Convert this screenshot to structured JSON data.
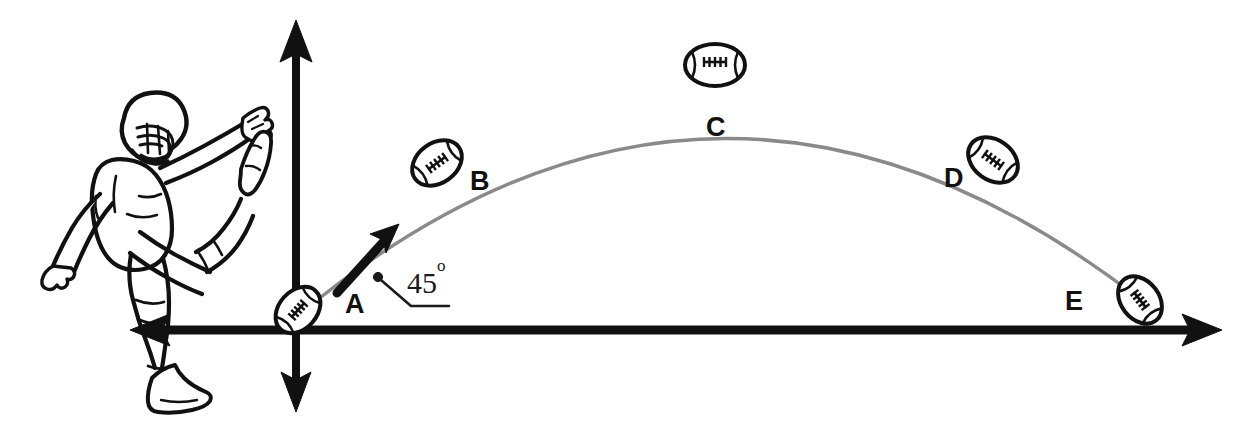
{
  "figure": {
    "background_color": "#ffffff",
    "ink_color": "#111111",
    "trajectory_color": "#8a8a8a",
    "width": 1260,
    "height": 437
  },
  "axes": {
    "x_axis_label": "",
    "y_axis_label": "",
    "origin_x": 296,
    "origin_y": 330,
    "x_left_end": 130,
    "x_right_end": 1222,
    "y_top_end": 20,
    "y_bottom_end": 410,
    "color": "#111111"
  },
  "angle_annotation": {
    "value": "45",
    "degree_symbol": "o",
    "text": "45",
    "dot_x": 378,
    "dot_y": 277
  },
  "velocity_arrow": {
    "name": "initial-velocity-vector",
    "angle_degrees": 45,
    "from_x": 337,
    "from_y": 292,
    "to_x": 397,
    "to_y": 226
  },
  "player": {
    "name": "football-player-kicking",
    "description": "Football player in kicking follow-through pose with helmet and facemask"
  },
  "chart_data": {
    "type": "scatter",
    "xlabel": "",
    "ylabel": "",
    "grid": false,
    "legend": null,
    "trajectory_shape": "parabola",
    "labels": [
      "A",
      "B",
      "C",
      "D",
      "E"
    ],
    "points": [
      {
        "label": "A",
        "x": 298,
        "y": 310,
        "rotation": -48,
        "rx": 26,
        "ry": 19,
        "label_x": 345,
        "label_y": 291,
        "phase": "launch"
      },
      {
        "label": "B",
        "x": 437,
        "y": 163,
        "rotation": -36,
        "rx": 27,
        "ry": 20,
        "label_x": 470,
        "label_y": 168,
        "phase": "rising"
      },
      {
        "label": "C",
        "x": 715,
        "y": 65,
        "rotation": 0,
        "rx": 30,
        "ry": 21,
        "label_x": 706,
        "label_y": 114,
        "phase": "apex"
      },
      {
        "label": "D",
        "x": 993,
        "y": 160,
        "rotation": 36,
        "rx": 27,
        "ry": 20,
        "label_x": 944,
        "label_y": 165,
        "phase": "falling"
      },
      {
        "label": "E",
        "x": 1140,
        "y": 300,
        "rotation": 52,
        "rx": 26,
        "ry": 19,
        "label_x": 1065,
        "label_y": 288,
        "phase": "landing"
      }
    ],
    "curve_path": "M 300 314 Q 715 -30 1141 300"
  }
}
